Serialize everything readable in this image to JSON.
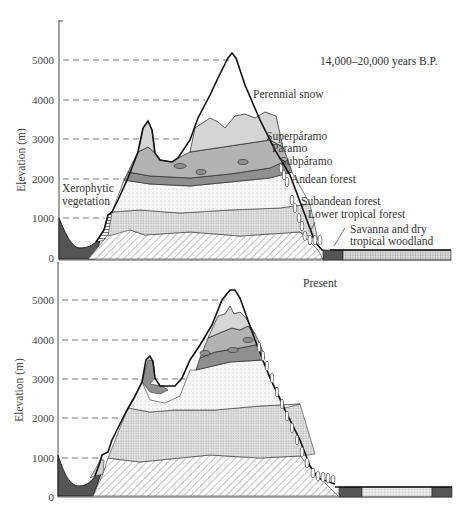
{
  "figure": {
    "type": "vegetation-zone cross-section diagram",
    "panels": [
      {
        "id": "past",
        "title": "14,000–20,000 years B.P.",
        "y_axis": {
          "label": "Elevation (m)",
          "ticks": [
            "0",
            "1000",
            "2000",
            "3000",
            "4000",
            "5000"
          ]
        },
        "zone_labels": [
          "Xerophytic vegetation",
          "Perennial snow",
          "Superpáramo",
          "Páramo",
          "Subpáramo",
          "Andean forest",
          "Subandean forest",
          "Lower tropical forest",
          "Savanna and dry tropical woodland"
        ]
      },
      {
        "id": "present",
        "title": "Present",
        "y_axis": {
          "label": "Elevation (m)",
          "ticks": [
            "0",
            "1000",
            "2000",
            "3000",
            "4000",
            "5000"
          ]
        }
      }
    ]
  },
  "labels": {
    "past_title": "14,000–20,000 years B.P.",
    "present_title": "Present",
    "y_label": "Elevation (m)",
    "xerophytic_1": "Xerophytic",
    "xerophytic_2": "vegetation",
    "perennial_snow": "Perennial snow",
    "superparamo": "Superpáramo",
    "paramo": "Páramo",
    "subparamo": "Subpáramo",
    "andean_forest": "Andean forest",
    "subandean_forest": "Subandean forest",
    "lower_tropical_forest": "Lower tropical forest",
    "savanna_1": "Savanna and dry",
    "savanna_2": "tropical woodland"
  },
  "ticks": {
    "t0": "0",
    "t1000": "1000",
    "t2000": "2000",
    "t3000": "3000",
    "t4000": "4000",
    "t5000": "5000"
  },
  "colors": {
    "outline": "#222222",
    "dark_valley": "#555555",
    "superparamo": "#d6d6d6",
    "paramo": "#b3b3b3",
    "subparamo": "#8f8f8f",
    "andean": "#f2f2f2",
    "subandean": "#e0e0e0",
    "lowland": "#ffffff"
  }
}
